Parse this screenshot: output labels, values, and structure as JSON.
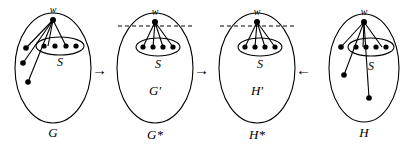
{
  "figure": {
    "width": 410,
    "height": 147,
    "background": "#ffffff",
    "stroke_color": "#000000",
    "node_color": "#000000"
  },
  "panels": [
    {
      "id": "panel-g",
      "outer_label": "G",
      "inner_label": "",
      "top_vertex_label": "w",
      "set_label": "S",
      "has_dashed_line": false,
      "set_vertex_count": 4,
      "outside_vertex_count": 3,
      "edges_to_set_count": 2,
      "edges_to_outside_count": 3
    },
    {
      "id": "panel-g-star",
      "outer_label": "G*",
      "inner_label": "G'",
      "top_vertex_label": "w",
      "set_label": "S",
      "has_dashed_line": true,
      "set_vertex_count": 4,
      "outside_vertex_count": 0,
      "edges_to_set_count": 4,
      "edges_to_outside_count": 0
    },
    {
      "id": "panel-h-star",
      "outer_label": "H*",
      "inner_label": "H'",
      "top_vertex_label": "w",
      "set_label": "S",
      "has_dashed_line": true,
      "set_vertex_count": 4,
      "outside_vertex_count": 0,
      "edges_to_set_count": 4,
      "edges_to_outside_count": 0
    },
    {
      "id": "panel-h",
      "outer_label": "H",
      "inner_label": "",
      "top_vertex_label": "w",
      "set_label": "S",
      "has_dashed_line": false,
      "set_vertex_count": 4,
      "outside_vertex_count": 3,
      "edges_to_set_count": 2,
      "edges_to_outside_count": 3
    }
  ],
  "arrows": [
    {
      "id": "arrow-g-to-gstar",
      "glyph": "→"
    },
    {
      "id": "arrow-gstar-to-hstar",
      "glyph": "→"
    },
    {
      "id": "arrow-h-to-hstar",
      "glyph": "←"
    }
  ]
}
